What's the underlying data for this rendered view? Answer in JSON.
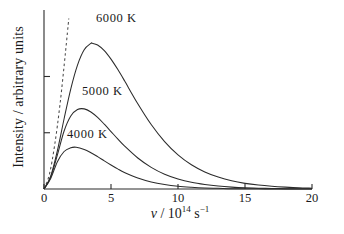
{
  "figure": {
    "y_axis_title": "Intensity / arbitrary units",
    "x_axis_symbol": "ν",
    "x_axis_divider": " / 10",
    "x_axis_exponent": "14",
    "x_axis_unit": " s",
    "x_axis_unit_exponent": "−1"
  },
  "axes": {
    "x_ticks": [
      "0",
      "5",
      "10",
      "15",
      "20"
    ],
    "y_tick_count": 2
  },
  "curves": {
    "labels": [
      "6000 K",
      "5000 K",
      "4000 K"
    ]
  },
  "chart_data": {
    "type": "line",
    "title": "",
    "xlabel": "ν / 10¹⁴ s⁻¹",
    "ylabel": "Intensity / arbitrary units",
    "xlim": [
      0,
      20
    ],
    "ylim": [
      0,
      1.05
    ],
    "xticks": [
      0,
      5,
      10,
      15,
      20
    ],
    "xticklabels": [
      "0",
      "5",
      "10",
      "15",
      "20"
    ],
    "yticks": [
      0.33,
      0.66
    ],
    "yticklabels": [
      "",
      ""
    ],
    "grid": false,
    "legend": "inline-annotations",
    "annotations": [
      {
        "text": "6000 K",
        "x": 5.0,
        "y": 1.0
      },
      {
        "text": "5000 K",
        "x": 3.6,
        "y": 0.6
      },
      {
        "text": "4000 K",
        "x": 2.3,
        "y": 0.36
      }
    ],
    "series": [
      {
        "name": "6000 K",
        "style": "solid",
        "peak_x": 3.6,
        "peak_y": 0.855,
        "x": [
          0,
          0.5,
          1,
          1.5,
          2,
          2.5,
          3,
          3.5,
          3.6,
          4,
          4.5,
          5,
          5.5,
          6,
          7,
          8,
          9,
          10,
          11,
          12,
          13,
          14,
          15,
          16,
          17,
          18,
          19,
          20
        ],
        "y": [
          0,
          0.075,
          0.225,
          0.412,
          0.588,
          0.727,
          0.817,
          0.854,
          0.855,
          0.845,
          0.812,
          0.762,
          0.702,
          0.636,
          0.5,
          0.378,
          0.278,
          0.2,
          0.142,
          0.1,
          0.07,
          0.048,
          0.033,
          0.023,
          0.016,
          0.011,
          0.007,
          0.005
        ]
      },
      {
        "name": "5000 K",
        "style": "solid",
        "peak_x": 3.0,
        "peak_y": 0.47,
        "x": [
          0,
          0.5,
          1,
          1.5,
          2,
          2.5,
          3,
          3.5,
          4,
          4.5,
          5,
          5.5,
          6,
          7,
          8,
          9,
          10,
          11,
          12,
          13,
          14,
          15,
          16,
          17,
          18,
          19,
          20
        ],
        "y": [
          0,
          0.07,
          0.2,
          0.34,
          0.428,
          0.466,
          0.47,
          0.452,
          0.42,
          0.38,
          0.337,
          0.294,
          0.253,
          0.182,
          0.127,
          0.087,
          0.059,
          0.039,
          0.026,
          0.017,
          0.011,
          0.007,
          0.005,
          0.003,
          0.002,
          0.001,
          0.001
        ]
      },
      {
        "name": "4000 K",
        "style": "solid",
        "peak_x": 2.4,
        "peak_y": 0.245,
        "x": [
          0,
          0.5,
          1,
          1.5,
          2,
          2.4,
          3,
          3.5,
          4,
          4.5,
          5,
          5.5,
          6,
          7,
          8,
          9,
          10,
          11,
          12,
          13,
          14,
          15,
          16,
          17,
          18,
          19,
          20
        ],
        "y": [
          0,
          0.062,
          0.16,
          0.22,
          0.242,
          0.245,
          0.232,
          0.213,
          0.19,
          0.165,
          0.141,
          0.118,
          0.097,
          0.064,
          0.041,
          0.026,
          0.016,
          0.01,
          0.006,
          0.004,
          0.002,
          0.0015,
          0.001,
          0.0006,
          0.0004,
          0.0002,
          0.0001
        ]
      },
      {
        "name": "Rayleigh-Jeans",
        "style": "dashed",
        "x": [
          0,
          0.4,
          0.8,
          1.2,
          1.6,
          1.85
        ],
        "y": [
          0,
          0.085,
          0.26,
          0.5,
          0.8,
          1.0
        ]
      }
    ]
  }
}
